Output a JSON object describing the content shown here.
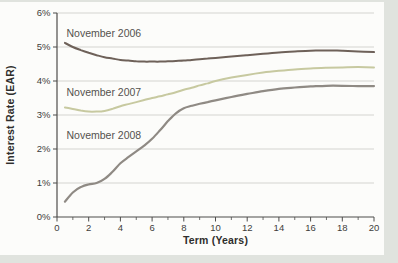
{
  "chart_data": {
    "type": "line",
    "title": "",
    "xlabel": "Term (Years)",
    "ylabel": "Interest Rate (EAR)",
    "xlim": [
      0,
      20
    ],
    "ylim": [
      0,
      6
    ],
    "grid": "horizontal",
    "legend_position": "inline-annotations",
    "x_ticks_major": [
      0,
      2,
      4,
      6,
      8,
      10,
      12,
      14,
      16,
      18,
      20
    ],
    "x_ticks_minor": [
      1,
      3,
      5,
      7,
      9,
      11,
      13,
      15,
      17,
      19
    ],
    "y_ticks": [
      0,
      1,
      2,
      3,
      4,
      5,
      6
    ],
    "y_tick_labels": [
      "0%",
      "1%",
      "2%",
      "3%",
      "4%",
      "5%",
      "6%"
    ],
    "x_tick_labels": [
      "0",
      "2",
      "4",
      "6",
      "8",
      "10",
      "12",
      "14",
      "16",
      "18",
      "20"
    ],
    "x": [
      0.5,
      1,
      1.5,
      2,
      2.5,
      3,
      3.5,
      4,
      4.5,
      5,
      5.5,
      6,
      6.5,
      7,
      7.5,
      8,
      8.5,
      9,
      9.5,
      10,
      11,
      12,
      13,
      14,
      15,
      16,
      17,
      18,
      19,
      20
    ],
    "series": [
      {
        "name": "November 2006",
        "color": "#6e6159",
        "stroke_width": 2,
        "label_at": {
          "x": 0.6,
          "y": 5.3
        },
        "values": [
          5.12,
          5.0,
          4.91,
          4.83,
          4.76,
          4.7,
          4.66,
          4.62,
          4.6,
          4.58,
          4.57,
          4.57,
          4.57,
          4.58,
          4.59,
          4.6,
          4.62,
          4.64,
          4.66,
          4.68,
          4.72,
          4.76,
          4.8,
          4.84,
          4.87,
          4.89,
          4.9,
          4.89,
          4.87,
          4.85
        ]
      },
      {
        "name": "November 2007",
        "color": "#c7c9a0",
        "stroke_width": 2,
        "label_at": {
          "x": 0.6,
          "y": 3.55
        },
        "values": [
          3.22,
          3.18,
          3.13,
          3.1,
          3.1,
          3.12,
          3.18,
          3.26,
          3.32,
          3.38,
          3.44,
          3.5,
          3.55,
          3.61,
          3.67,
          3.74,
          3.8,
          3.87,
          3.93,
          4.0,
          4.1,
          4.18,
          4.25,
          4.3,
          4.34,
          4.37,
          4.39,
          4.4,
          4.41,
          4.4
        ]
      },
      {
        "name": "November 2008",
        "color": "#8f8a84",
        "stroke_width": 2.2,
        "label_at": {
          "x": 0.6,
          "y": 2.28
        },
        "values": [
          0.45,
          0.72,
          0.88,
          0.96,
          1.0,
          1.12,
          1.33,
          1.58,
          1.76,
          1.93,
          2.1,
          2.3,
          2.55,
          2.82,
          3.05,
          3.2,
          3.27,
          3.33,
          3.38,
          3.43,
          3.53,
          3.62,
          3.7,
          3.77,
          3.81,
          3.84,
          3.86,
          3.86,
          3.85,
          3.85
        ]
      }
    ],
    "axis_color": "#4d4c4a",
    "grid_color": "#d4d4d0"
  }
}
